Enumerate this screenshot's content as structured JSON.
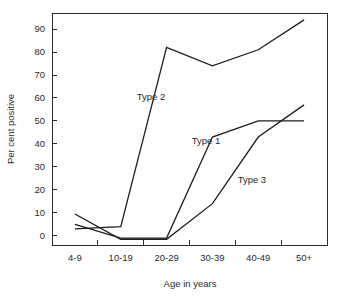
{
  "chart_data": {
    "type": "line",
    "title": "",
    "xlabel": "Age in years",
    "ylabel": "Per cent positive",
    "categories": [
      "4-9",
      "10-19",
      "20-29",
      "30-39",
      "40-49",
      "50+"
    ],
    "ylim": [
      -4,
      97
    ],
    "ytick_values": [
      0,
      10,
      20,
      30,
      40,
      50,
      60,
      70,
      80,
      90
    ],
    "ytick_labels": [
      "0",
      "10",
      "20",
      "30",
      "40",
      "50",
      "60",
      "70",
      "80",
      "90"
    ],
    "grid": false,
    "legend": "inline-labels",
    "line_color": "#1d1d1d",
    "series": [
      {
        "name": "Type 1",
        "label": "Type 1",
        "values": [
          5,
          -1,
          -1,
          43,
          50,
          50
        ]
      },
      {
        "name": "Type 2",
        "label": "Type 2",
        "values": [
          3,
          4,
          82,
          74,
          81,
          94
        ]
      },
      {
        "name": "Type 3",
        "label": "Type 3",
        "values": [
          9.5,
          -1.5,
          -1.5,
          14,
          43,
          57
        ]
      }
    ],
    "annotations": [
      {
        "text": "Type 2",
        "x_value": 1.35,
        "y_value": 59
      },
      {
        "text": "Type 1",
        "x_value": 2.55,
        "y_value": 40
      },
      {
        "text": "Type 3",
        "x_value": 3.55,
        "y_value": 23
      }
    ]
  }
}
